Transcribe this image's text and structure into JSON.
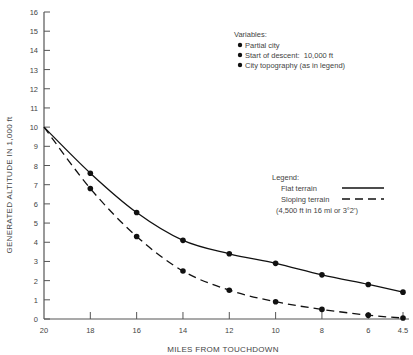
{
  "chart_data": {
    "type": "line",
    "title": "",
    "xlabel": "MILES FROM TOUCHDOWN",
    "ylabel": "GENERATED ALTITUDE IN 1,000 ft",
    "x": [
      20,
      18,
      16,
      14,
      12,
      10,
      8,
      6,
      4.5
    ],
    "x_tick_labels": [
      "20",
      "18",
      "16",
      "14",
      "12",
      "10",
      "8",
      "6",
      "4.5"
    ],
    "y_ticks": [
      0,
      1,
      2,
      3,
      4,
      5,
      6,
      7,
      8,
      9,
      10,
      11,
      12,
      13,
      14,
      15,
      16
    ],
    "xlim": [
      20,
      4.5
    ],
    "ylim": [
      0,
      16
    ],
    "grid": false,
    "series": [
      {
        "name": "Flat terrain",
        "style": "solid",
        "values": [
          10,
          7.6,
          5.55,
          4.1,
          3.4,
          2.9,
          2.3,
          1.8,
          1.4
        ]
      },
      {
        "name": "Sloping terrain",
        "style": "dashed",
        "values": [
          10,
          6.8,
          4.3,
          2.5,
          1.5,
          0.9,
          0.5,
          0.2,
          0.05
        ]
      }
    ],
    "annotations": {
      "variables_title": "Variables:",
      "variables": [
        "Partial city",
        "Start of descent:  10,000 ft",
        "City topography (as in legend)"
      ],
      "legend_title": "Legend:",
      "legend_note": "(4,500 ft in 16 mi or 3°2')"
    }
  }
}
